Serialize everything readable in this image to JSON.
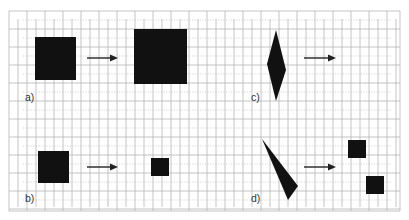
{
  "diagram": {
    "colors": {
      "shape": "#111111",
      "grid": "#b5b5b5",
      "arrow": "#222222"
    },
    "panels": [
      {
        "id": "a",
        "label": "a)",
        "before": "large square",
        "after": "larger square (enlargement)"
      },
      {
        "id": "b",
        "label": "b)",
        "before": "square",
        "after": "smaller square (reduction)"
      },
      {
        "id": "c",
        "label": "c)",
        "before": "diamond / rhombus",
        "after": "empty (to be drawn)"
      },
      {
        "id": "d",
        "label": "d)",
        "before": "thin triangle",
        "after": "two small squares"
      }
    ]
  }
}
